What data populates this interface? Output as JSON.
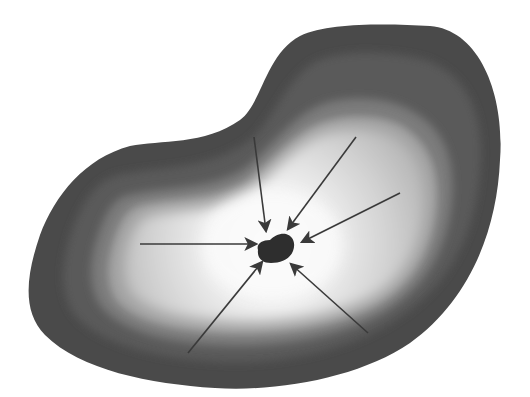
{
  "diagram": {
    "colors": {
      "background": "#ffffff",
      "outer_rim": "#4a4a4a",
      "band_2": "#5e5e5e",
      "band_3": "#777777",
      "band_4": "#9a9a9a",
      "band_5": "#bdbdbd",
      "interior": "#dcdcdc",
      "center_glow": "#fafafa",
      "nucleus": "#2e2e2e",
      "arrow": "#3a3a3a"
    },
    "nucleus": {
      "label": "center",
      "bbox": [
        255,
        234,
        294,
        263
      ]
    },
    "arrows": [
      {
        "name": "arrow-from-top",
        "from": [
          254,
          137
        ],
        "to": [
          266,
          231
        ]
      },
      {
        "name": "arrow-from-upper-right",
        "from": [
          356,
          137
        ],
        "to": [
          288,
          229
        ]
      },
      {
        "name": "arrow-from-right",
        "from": [
          400,
          193
        ],
        "to": [
          302,
          242
        ]
      },
      {
        "name": "arrow-from-left",
        "from": [
          140,
          244
        ],
        "to": [
          256,
          244
        ]
      },
      {
        "name": "arrow-from-lower-left",
        "from": [
          188,
          353
        ],
        "to": [
          262,
          262
        ]
      },
      {
        "name": "arrow-from-lower-right",
        "from": [
          368,
          333
        ],
        "to": [
          291,
          264
        ]
      }
    ],
    "arrow_count": 6
  }
}
